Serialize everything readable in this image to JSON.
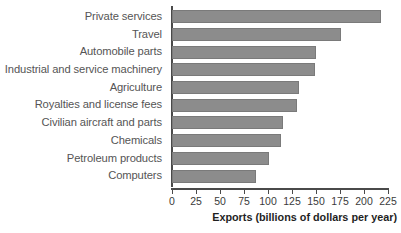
{
  "chart_data": {
    "type": "bar",
    "orientation": "horizontal",
    "title": "",
    "xlabel": "Exports (billions of dollars per year)",
    "ylabel": "",
    "xlim": [
      0,
      225
    ],
    "xticks": [
      0,
      25,
      50,
      75,
      100,
      125,
      150,
      175,
      200,
      225
    ],
    "grid": false,
    "legend": null,
    "bar_color": "#8c8c8c",
    "axis_color": "#4a4a4a",
    "categories": [
      "Private services",
      "Travel",
      "Automobile parts",
      "Industrial and service machinery",
      "Agriculture",
      "Royalties and license fees",
      "Civilian aircraft and parts",
      "Chemicals",
      "Petroleum products",
      "Computers"
    ],
    "values": [
      218,
      176,
      150,
      149,
      132,
      130,
      116,
      114,
      101,
      88
    ]
  }
}
